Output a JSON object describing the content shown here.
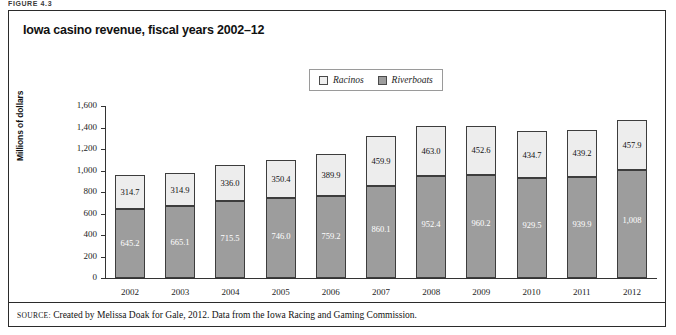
{
  "figure_label": "FIGURE 4.3",
  "panel": {
    "title": "Iowa casino revenue, fiscal years 2002–12",
    "source_kicker": "SOURCE:",
    "source_text": " Created by Melissa Doak for Gale, 2012. Data from the Iowa Racing and Gaming Commission."
  },
  "legend": {
    "position": "top-center",
    "items": [
      {
        "label": "Racinos",
        "swatch": "racinos-swatch",
        "color": "#ededed"
      },
      {
        "label": "Riverboats",
        "swatch": "riverboats-swatch",
        "color": "#9d9d9d"
      }
    ]
  },
  "chart_data": {
    "type": "bar",
    "stacked": true,
    "title": "Iowa casino revenue, fiscal years 2002–12",
    "xlabel": "",
    "ylabel": "Millions of dollars",
    "ylim": [
      0,
      1600
    ],
    "ytick_step": 200,
    "grid": false,
    "legend_position": "top-center",
    "categories": [
      "2002",
      "2003",
      "2004",
      "2005",
      "2006",
      "2007",
      "2008",
      "2009",
      "2010",
      "2011",
      "2012"
    ],
    "ytick_labels": [
      "0",
      "200",
      "400",
      "600",
      "800",
      "1,000",
      "1,200",
      "1,400",
      "1,600"
    ],
    "series": [
      {
        "name": "Riverboats",
        "color": "#9d9d9d",
        "values": [
          645.2,
          665.1,
          715.5,
          746.0,
          759.2,
          860.1,
          952.4,
          960.2,
          929.5,
          939.9,
          1008
        ],
        "labels": [
          "645.2",
          "665.1",
          "715.5",
          "746.0",
          "759.2",
          "860.1",
          "952.4",
          "960.2",
          "929.5",
          "939.9",
          "1,008"
        ]
      },
      {
        "name": "Racinos",
        "color": "#ededed",
        "values": [
          314.7,
          314.9,
          336.0,
          350.4,
          389.9,
          459.9,
          463.0,
          452.6,
          434.7,
          439.2,
          457.9
        ],
        "labels": [
          "314.7",
          "314.9",
          "336.0",
          "350.4",
          "389.9",
          "459.9",
          "463.0",
          "452.6",
          "434.7",
          "439.2",
          "457.9"
        ]
      }
    ]
  }
}
